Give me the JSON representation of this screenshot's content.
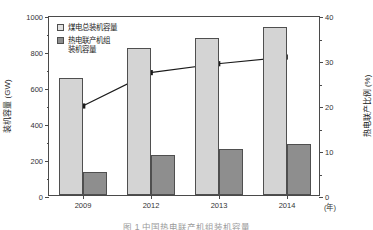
{
  "chart_data": {
    "type": "bar",
    "title": "",
    "categories": [
      "2009",
      "2012",
      "2013",
      "2014"
    ],
    "xlabel": "(年)",
    "ylabel": "装机容量 (GW)",
    "y2label": "热电联产比例 (%)",
    "ylim": [
      0,
      1000
    ],
    "y2lim": [
      0,
      40
    ],
    "yticks": [
      0,
      200,
      400,
      600,
      800,
      1000
    ],
    "y2ticks": [
      0,
      10,
      20,
      30,
      40
    ],
    "grid": false,
    "legend_position": "top-left",
    "series": [
      {
        "name": "煤电总装机容量",
        "kind": "bar",
        "axis": "left",
        "color": "#d4d4d4",
        "values": [
          650,
          815,
          875,
          935
        ]
      },
      {
        "name": "热电联产机组装机容量",
        "kind": "bar",
        "axis": "left",
        "color": "#8e8e8e",
        "values": [
          130,
          225,
          255,
          285
        ]
      },
      {
        "name": "热电联产比例",
        "kind": "line",
        "axis": "right",
        "color": "#1a1a1a",
        "values": [
          20,
          27.5,
          29.5,
          31
        ]
      }
    ]
  },
  "legend": {
    "items": [
      {
        "label": "煤电总装机容量",
        "color": "#e2e2e2"
      },
      {
        "label": "热电联产机组\n装机容量",
        "color": "#8e8e8e"
      }
    ]
  },
  "axes": {
    "left": {
      "title": "装机容量 (GW)",
      "ticklabels": [
        "1000",
        "800",
        "600",
        "400",
        "200",
        "0"
      ]
    },
    "right": {
      "title": "热电联产比例 (%)",
      "ticklabels": [
        "40",
        "30",
        "20",
        "10",
        "0"
      ]
    },
    "bottom": {
      "ticklabels": [
        "2009",
        "2012",
        "2013",
        "2014"
      ],
      "unit": "(年)"
    }
  },
  "caption": {
    "text": "图 1   中国热电联产机组装机容量"
  }
}
